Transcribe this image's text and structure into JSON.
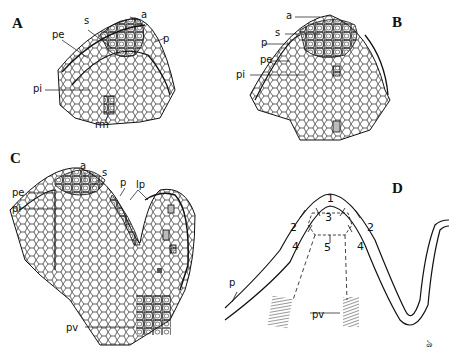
{
  "figure": {
    "panels": [
      {
        "letter": "A",
        "labels": [
          "a",
          "s",
          "pe",
          "p",
          "pi",
          "rm"
        ]
      },
      {
        "letter": "B",
        "labels": [
          "a",
          "s",
          "p",
          "pe",
          "pi"
        ]
      },
      {
        "letter": "C",
        "labels": [
          "a",
          "s",
          "p",
          "lp",
          "pe",
          "pi",
          "pv"
        ]
      },
      {
        "letter": "D",
        "labels": [
          "1",
          "2",
          "3",
          "4",
          "5",
          "p",
          "pv"
        ]
      }
    ],
    "panelA": {
      "letter": "A",
      "a": "a",
      "s": "s",
      "pe": "pe",
      "p": "p",
      "pi": "pi",
      "rm": "rm"
    },
    "panelB": {
      "letter": "B",
      "a": "a",
      "s": "s",
      "p": "p",
      "pe": "pe",
      "pi": "pi"
    },
    "panelC": {
      "letter": "C",
      "a": "a",
      "s": "s",
      "p": "p",
      "lp": "lp",
      "pe": "pe",
      "pi": "pi",
      "pv": "pv"
    },
    "panelD": {
      "letter": "D",
      "zone1": "1",
      "zone2": "2",
      "zone3": "3",
      "zone4": "4",
      "zone5": "5",
      "p": "p",
      "pv": "pv"
    },
    "signature": "ঌ"
  }
}
